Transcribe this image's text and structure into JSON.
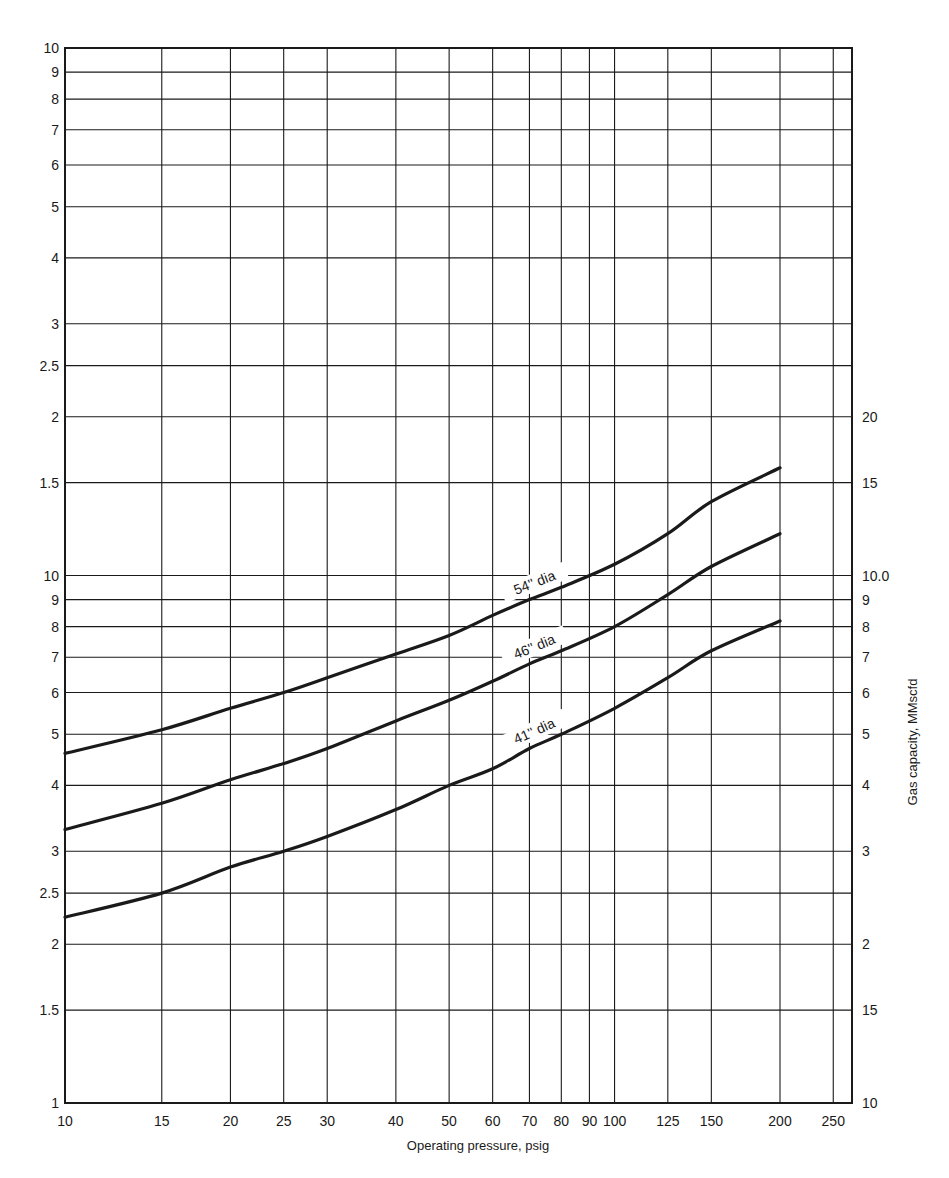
{
  "chart_data": {
    "type": "line",
    "title": "",
    "xlabel": "Operating pressure, psig",
    "ylabel_right": "Gas capacity, MMscfd",
    "x_scale": "log",
    "y_scale": "log",
    "xlim": [
      10,
      280
    ],
    "ylim": [
      1,
      100
    ],
    "grid": true,
    "legend_position": "inline labels on curves",
    "x_ticks": [
      10,
      15,
      20,
      25,
      30,
      40,
      50,
      60,
      70,
      80,
      90,
      100,
      125,
      150,
      200,
      250
    ],
    "x_tick_labels": [
      "10",
      "15",
      "20",
      "25",
      "30",
      "40",
      "50",
      "60",
      "70",
      "80",
      "90",
      "100",
      "125",
      "150",
      "200",
      "250"
    ],
    "y_left_ticks": [
      1,
      1.5,
      2,
      2.5,
      3,
      4,
      5,
      6,
      7,
      8,
      9,
      10,
      15,
      20,
      25,
      30,
      40,
      50,
      60,
      70,
      80,
      90,
      100
    ],
    "y_left_tick_labels": [
      "1",
      "1.5",
      "2",
      "2.5",
      "3",
      "4",
      "5",
      "6",
      "7",
      "8",
      "9",
      "10",
      "1.5",
      "2",
      "2.5",
      "3",
      "4",
      "5",
      "6",
      "7",
      "8",
      "9",
      "10"
    ],
    "y_right_ticks": [
      1,
      1.5,
      2,
      3,
      4,
      5,
      6,
      7,
      8,
      9,
      10,
      15,
      20
    ],
    "y_right_tick_labels": [
      "10",
      "15",
      "2",
      "3",
      "4",
      "5",
      "6",
      "7",
      "8",
      "9",
      "10.0",
      "15",
      "20"
    ],
    "x": [
      10,
      15,
      20,
      25,
      30,
      40,
      50,
      60,
      70,
      80,
      100,
      125,
      150,
      200
    ],
    "series": [
      {
        "name": "54\" dia",
        "label": "54'' dia",
        "values": [
          4.6,
          5.1,
          5.6,
          6.0,
          6.4,
          7.1,
          7.7,
          8.4,
          9.0,
          9.5,
          10.5,
          12.0,
          13.8,
          16.0
        ]
      },
      {
        "name": "46\" dia",
        "label": "46'' dia",
        "values": [
          3.3,
          3.7,
          4.1,
          4.4,
          4.7,
          5.3,
          5.8,
          6.3,
          6.8,
          7.2,
          8.0,
          9.2,
          10.4,
          12.0
        ]
      },
      {
        "name": "41\" dia",
        "label": "41'' dia",
        "values": [
          2.25,
          2.5,
          2.8,
          3.0,
          3.2,
          3.6,
          4.0,
          4.3,
          4.7,
          5.0,
          5.6,
          6.4,
          7.2,
          8.2
        ]
      }
    ],
    "colors": {
      "line": "#1a1a1a",
      "grid": "#1a1a1a",
      "background": "#ffffff"
    }
  }
}
